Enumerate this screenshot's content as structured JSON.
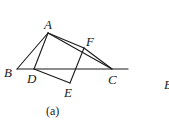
{
  "figure": {
    "caption": "(a)",
    "points": {
      "A": {
        "label": "A",
        "x": 48,
        "y": 33
      },
      "B": {
        "label": "B",
        "x": 17,
        "y": 69
      },
      "C": {
        "label": "C",
        "x": 112,
        "y": 69
      },
      "D": {
        "label": "D",
        "x": 34,
        "y": 69
      },
      "E": {
        "label": "E",
        "x": 70,
        "y": 83
      },
      "F": {
        "label": "F",
        "x": 84,
        "y": 48
      }
    },
    "segments": [
      [
        "B",
        "A"
      ],
      [
        "A",
        "D"
      ],
      [
        "A",
        "F"
      ],
      [
        "A",
        "C"
      ],
      [
        "F",
        "C"
      ],
      [
        "D",
        "E"
      ],
      [
        "E",
        "F"
      ]
    ],
    "baseline_extension_x": 128,
    "partial_label_right": "B"
  }
}
